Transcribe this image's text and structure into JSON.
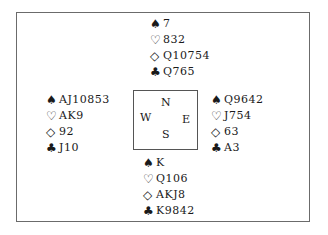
{
  "suits": {
    "spades": "♠",
    "hearts": "♡",
    "diamonds": "◇",
    "clubs": "♣"
  },
  "compass": {
    "north": "N",
    "south": "S",
    "east": "E",
    "west": "W"
  },
  "hands": {
    "north": {
      "spades": "7",
      "hearts": "832",
      "diamonds": "Q10754",
      "clubs": "Q765"
    },
    "west": {
      "spades": "AJ10853",
      "hearts": "AK9",
      "diamonds": "92",
      "clubs": "J10"
    },
    "east": {
      "spades": "Q9642",
      "hearts": "J754",
      "diamonds": "63",
      "clubs": "A3"
    },
    "south": {
      "spades": "K",
      "hearts": "Q106",
      "diamonds": "AKJ8",
      "clubs": "K9842"
    }
  }
}
